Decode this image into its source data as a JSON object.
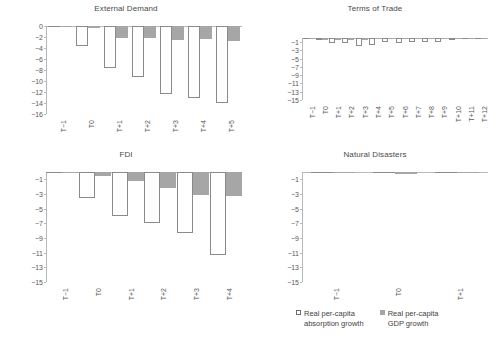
{
  "legend": {
    "items": [
      {
        "key": "absorption",
        "label": "Real per-capita\nabsorption growth"
      },
      {
        "key": "gdp",
        "label": "Real per-capita\nGDP growth"
      }
    ]
  },
  "chart_data": [
    {
      "id": "external-demand",
      "type": "bar",
      "title": "External Demand",
      "xlabel": "",
      "ylabel": "",
      "ylim": [
        -16,
        0
      ],
      "yticks": [
        0,
        -2,
        -4,
        -6,
        -8,
        -10,
        -12,
        -14,
        -16
      ],
      "grid": false,
      "legend_position": "figure-bottom",
      "categories": [
        "T−1",
        "T0",
        "T+1",
        "T+2",
        "T+3",
        "T+4",
        "T+5"
      ],
      "series": [
        {
          "name": "Real per-capita absorption growth",
          "values": [
            0,
            -3.6,
            -7.6,
            -9.2,
            -12.3,
            -13.1,
            -14.0
          ]
        },
        {
          "name": "Real per-capita GDP growth",
          "values": [
            0,
            -0.3,
            -2.1,
            -2.2,
            -2.6,
            -2.4,
            -2.7
          ]
        }
      ]
    },
    {
      "id": "terms-of-trade",
      "type": "bar",
      "title": "Terms of Trade",
      "xlabel": "",
      "ylabel": "",
      "ylim": [
        -15,
        0
      ],
      "yticks": [
        -1,
        -3,
        -5,
        -7,
        -9,
        -11,
        -13,
        -15
      ],
      "grid": false,
      "legend_position": "figure-bottom",
      "categories": [
        "T−1",
        "T0",
        "T+1",
        "T+2",
        "T+3",
        "T+4",
        "T+5",
        "T+6",
        "T+7",
        "T+8",
        "T+9",
        "T+10",
        "T+11",
        "T+12"
      ],
      "series": [
        {
          "name": "Real per-capita absorption growth",
          "values": [
            0,
            -0.1,
            -1.3,
            -1.3,
            -1.9,
            -1.7,
            -1.0,
            -1.1,
            -0.9,
            -0.9,
            -0.9,
            -0.1,
            0,
            0
          ]
        },
        {
          "name": "Real per-capita GDP growth",
          "values": [
            0,
            -0.2,
            -0.5,
            -0.5,
            -0.1,
            0,
            0,
            0,
            0,
            0,
            0,
            0,
            0,
            0
          ]
        }
      ]
    },
    {
      "id": "fdi",
      "type": "bar",
      "title": "FDI",
      "xlabel": "",
      "ylabel": "",
      "ylim": [
        -15,
        0
      ],
      "yticks": [
        -1,
        -3,
        -5,
        -7,
        -9,
        -11,
        -13,
        -15
      ],
      "grid": false,
      "legend_position": "figure-bottom",
      "categories": [
        "T−1",
        "T0",
        "T+1",
        "T+2",
        "T+3",
        "T+4"
      ],
      "series": [
        {
          "name": "Real per-capita absorption growth",
          "values": [
            0,
            -3.5,
            -6.0,
            -6.9,
            -8.3,
            -11.3
          ]
        },
        {
          "name": "Real per-capita GDP growth",
          "values": [
            0,
            -0.5,
            -1.2,
            -2.2,
            -3.2,
            -3.3
          ]
        }
      ]
    },
    {
      "id": "natural-disasters",
      "type": "bar",
      "title": "Natural Disasters",
      "xlabel": "",
      "ylabel": "",
      "ylim": [
        -15,
        0
      ],
      "yticks": [
        -1,
        -3,
        -5,
        -7,
        -9,
        -11,
        -13,
        -15
      ],
      "grid": false,
      "legend_position": "figure-bottom",
      "categories": [
        "T−1",
        "T0",
        "T+1"
      ],
      "series": [
        {
          "name": "Real per-capita absorption growth",
          "values": [
            0,
            0,
            0
          ]
        },
        {
          "name": "Real per-capita GDP growth",
          "values": [
            0,
            -0.12,
            0
          ]
        }
      ]
    }
  ],
  "colors": {
    "absorption_fill": "#ffffff",
    "absorption_stroke": "#8a8a8a",
    "gdp_fill": "#a6a6a6",
    "axis": "#b8b8b8",
    "text": "#585858",
    "background": "#ffffff"
  }
}
